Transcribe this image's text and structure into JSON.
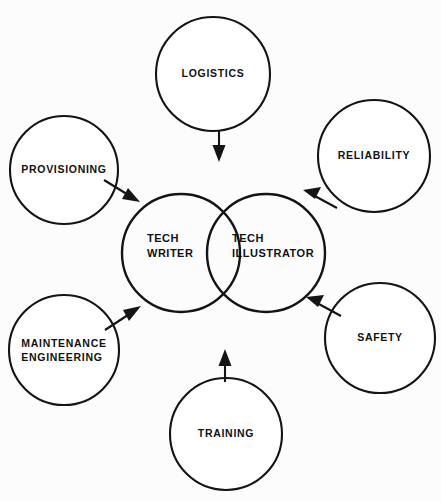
{
  "diagram": {
    "type": "venn-hub-and-spoke",
    "background_color": "#fcfcfc",
    "stroke_color": "#141414",
    "center": {
      "writer": {
        "label_line1": "TECH",
        "label_line2": "WRITER",
        "cx": 181,
        "cy": 253,
        "r": 59
      },
      "illustrator": {
        "label_line1": "TECH",
        "label_line2": "ILLUSTRATOR",
        "cx": 266,
        "cy": 253,
        "r": 59
      }
    },
    "sources": [
      {
        "id": "logistics",
        "label": "LOGISTICS",
        "cx": 213,
        "cy": 74,
        "r": 57,
        "label_x": 213,
        "label_y": 74,
        "arrow": {
          "x1": 219,
          "y1": 131,
          "x2": 219,
          "y2": 160,
          "direction": "down",
          "target": "center"
        }
      },
      {
        "id": "provisioning",
        "label": "PROVISIONING",
        "cx": 64,
        "cy": 170,
        "r": 54,
        "label_x": 64,
        "label_y": 170,
        "arrow": {
          "x1": 104,
          "y1": 180,
          "x2": 138,
          "y2": 201,
          "direction": "down-right",
          "target": "tech-writer"
        }
      },
      {
        "id": "maintenance-engineering",
        "label": "MAINTENANCE\nENGINEERING",
        "cx": 64,
        "cy": 350,
        "r": 55,
        "label_x": 64,
        "label_y": 350,
        "arrow": {
          "x1": 105,
          "y1": 329,
          "x2": 139,
          "y2": 307,
          "direction": "up-right",
          "target": "tech-writer"
        }
      },
      {
        "id": "reliability",
        "label": "RELIABILITY",
        "cx": 374,
        "cy": 156,
        "r": 56,
        "label_x": 374,
        "label_y": 156,
        "arrow": {
          "x1": 336,
          "y1": 207,
          "x2": 305,
          "y2": 191,
          "direction": "up-left",
          "target": "tech-illustrator"
        }
      },
      {
        "id": "safety",
        "label": "SAFETY",
        "cx": 380,
        "cy": 338,
        "r": 55,
        "label_x": 380,
        "label_y": 338,
        "arrow": {
          "x1": 340,
          "y1": 315,
          "x2": 308,
          "y2": 298,
          "direction": "up-left",
          "target": "tech-illustrator"
        }
      },
      {
        "id": "training",
        "label": "TRAINING",
        "cx": 226,
        "cy": 434,
        "r": 56,
        "label_x": 226,
        "label_y": 434,
        "arrow": {
          "x1": 225,
          "y1": 382,
          "x2": 225,
          "y2": 350,
          "direction": "up",
          "target": "center"
        }
      }
    ]
  }
}
